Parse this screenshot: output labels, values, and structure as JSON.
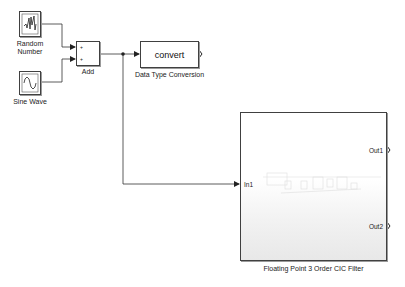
{
  "blocks": {
    "random_number": {
      "label_line1": "Random",
      "label_line2": "Number",
      "icon": "random-signal-icon"
    },
    "sine_wave": {
      "label": "Sine Wave",
      "icon": "sine-wave-icon"
    },
    "add": {
      "label": "Add",
      "port_signs": [
        "+",
        "+"
      ]
    },
    "data_type_conversion": {
      "label": "Data Type Conversion",
      "text": "convert"
    },
    "cic_filter": {
      "label": "Floating Point 3 Order CIC Filter",
      "inputs": [
        "In1"
      ],
      "outputs": [
        "Out1",
        "Out2"
      ]
    }
  },
  "colors": {
    "wire": "#333333",
    "block_border": "#404040",
    "background": "#ffffff"
  }
}
